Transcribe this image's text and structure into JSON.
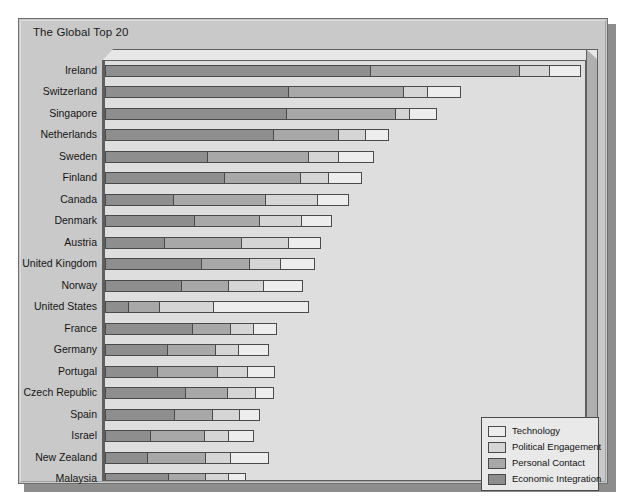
{
  "chart_title": "The Global Top 20",
  "legend": {
    "position": "bottom-right",
    "items": [
      {
        "label": "Technology",
        "color": "#ededed",
        "key": "technology"
      },
      {
        "label": "Political Engagement",
        "color": "#d5d5d5",
        "key": "political_engagement"
      },
      {
        "label": "Personal Contact",
        "color": "#a8a8a8",
        "key": "personal_contact"
      },
      {
        "label": "Economic Integration",
        "color": "#8e8e8e",
        "key": "economic_integration"
      }
    ]
  },
  "chart_data": {
    "type": "bar",
    "orientation": "horizontal",
    "stacked": true,
    "title": "The Global Top 20",
    "xlabel": "",
    "ylabel": "",
    "grid": false,
    "legend_position": "bottom-right",
    "xlim": [
      0,
      100
    ],
    "series": [
      {
        "name": "Economic Integration",
        "color": "#8e8e8e",
        "values": [
          55.6,
          38.4,
          37.9,
          35.2,
          21.5,
          25.0,
          14.4,
          18.8,
          12.5,
          20.3,
          16.1,
          5.0,
          18.4,
          13.2,
          11.1,
          16.9,
          14.6,
          9.6,
          9.0,
          13.4
        ]
      },
      {
        "name": "Personal Contact",
        "color": "#a8a8a8",
        "values": [
          31.3,
          24.2,
          23.0,
          13.8,
          21.3,
          16.2,
          19.4,
          13.8,
          16.3,
          10.2,
          10.0,
          6.7,
          8.1,
          10.2,
          12.6,
          9.0,
          8.1,
          11.5,
          12.3,
          8.0
        ]
      },
      {
        "name": "Political Engagement",
        "color": "#d5d5d5",
        "values": [
          6.5,
          5.3,
          3.1,
          6.0,
          6.5,
          5.9,
          11.0,
          9.0,
          10.1,
          6.7,
          7.6,
          11.5,
          5.1,
          5.0,
          6.5,
          6.0,
          6.0,
          5.2,
          5.5,
          5.0
        ]
      },
      {
        "name": "Technology",
        "color": "#ededed",
        "values": [
          6.6,
          7.1,
          6.0,
          5.0,
          7.5,
          7.1,
          6.7,
          6.5,
          6.8,
          7.3,
          8.3,
          20.0,
          5.0,
          6.4,
          5.9,
          4.0,
          4.3,
          5.5,
          8.1,
          3.6
        ]
      }
    ],
    "categories": [
      "Ireland",
      "Switzerland",
      "Singapore",
      "Netherlands",
      "Sweden",
      "Finland",
      "Canada",
      "Denmark",
      "Austria",
      "United Kingdom",
      "Norway",
      "United States",
      "France",
      "Germany",
      "Portugal",
      "Czech Republic",
      "Spain",
      "Israel",
      "New Zealand",
      "Malaysia"
    ],
    "totals": [
      100.0,
      75.0,
      70.0,
      60.0,
      56.8,
      54.2,
      51.5,
      48.1,
      45.7,
      44.5,
      42.0,
      43.2,
      36.6,
      34.8,
      36.1,
      35.9,
      33.0,
      31.8,
      34.9,
      30.0
    ]
  }
}
